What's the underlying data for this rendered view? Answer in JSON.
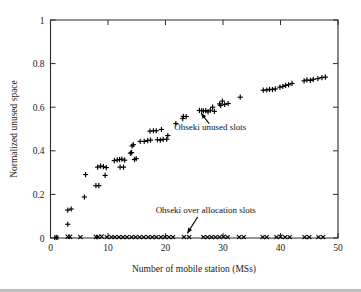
{
  "chart_data": {
    "type": "scatter",
    "title": "",
    "xlabel": "Number of mobile station (MSs)",
    "ylabel": "Normalized unused space",
    "xlim": [
      0,
      50
    ],
    "ylim": [
      0,
      1
    ],
    "xticks": [
      0,
      10,
      20,
      30,
      40,
      50
    ],
    "yticks": [
      0,
      0.2,
      0.4,
      0.6,
      0.8,
      1
    ],
    "xtick_labels": [
      "0",
      "10",
      "20",
      "30",
      "40",
      "50"
    ],
    "ytick_labels": [
      "0",
      "0.2",
      "0.4",
      "0.6",
      "0.8",
      "1"
    ],
    "grid": false,
    "legend": "none",
    "annotations": [
      {
        "id": "unused-slots",
        "text": "Ohseki unused slots",
        "text_x": 27.8,
        "text_y": 0.495,
        "arrow_from_x": 27.6,
        "arrow_from_y": 0.525,
        "arrow_to_x": 26.2,
        "arrow_to_y": 0.572
      },
      {
        "id": "over-allocation-slots",
        "text": "Ohseki over allocation slots",
        "text_x": 27.0,
        "text_y": 0.115,
        "arrow_from_x": 25.6,
        "arrow_from_y": 0.097,
        "arrow_to_x": 23.8,
        "arrow_to_y": 0.022
      }
    ],
    "series": [
      {
        "name": "Ohseki unused slots",
        "marker": "plus",
        "color": "#000000",
        "points": [
          [
            1,
            0.003
          ],
          [
            3,
            0.063
          ],
          [
            3,
            0.128
          ],
          [
            3.6,
            0.133
          ],
          [
            5.9,
            0.188
          ],
          [
            6.1,
            0.291
          ],
          [
            7.9,
            0.24
          ],
          [
            8.4,
            0.24
          ],
          [
            8.2,
            0.325
          ],
          [
            8.7,
            0.33
          ],
          [
            9.2,
            0.327
          ],
          [
            9.5,
            0.287
          ],
          [
            9.7,
            0.323
          ],
          [
            11.1,
            0.355
          ],
          [
            11.6,
            0.358
          ],
          [
            12.0,
            0.36
          ],
          [
            12.4,
            0.362
          ],
          [
            12.1,
            0.325
          ],
          [
            12.7,
            0.325
          ],
          [
            12.9,
            0.357
          ],
          [
            13.9,
            0.389
          ],
          [
            14.1,
            0.392
          ],
          [
            14.2,
            0.422
          ],
          [
            14.4,
            0.428
          ],
          [
            14.6,
            0.36
          ],
          [
            14.9,
            0.364
          ],
          [
            15.6,
            0.443
          ],
          [
            16.3,
            0.443
          ],
          [
            16.9,
            0.447
          ],
          [
            17.4,
            0.449
          ],
          [
            17.3,
            0.49
          ],
          [
            17.9,
            0.492
          ],
          [
            18.4,
            0.492
          ],
          [
            18.6,
            0.451
          ],
          [
            19.1,
            0.449
          ],
          [
            19.3,
            0.498
          ],
          [
            19.6,
            0.452
          ],
          [
            20.2,
            0.453
          ],
          [
            20.4,
            0.47
          ],
          [
            21.8,
            0.525
          ],
          [
            23.0,
            0.548
          ],
          [
            23.1,
            0.558
          ],
          [
            23.6,
            0.557
          ],
          [
            25.9,
            0.585
          ],
          [
            26.3,
            0.584
          ],
          [
            26.6,
            0.583
          ],
          [
            27.0,
            0.584
          ],
          [
            27.4,
            0.579
          ],
          [
            27.8,
            0.586
          ],
          [
            28.2,
            0.6
          ],
          [
            28.5,
            0.581
          ],
          [
            29.4,
            0.615
          ],
          [
            29.6,
            0.608
          ],
          [
            29.9,
            0.628
          ],
          [
            30.3,
            0.613
          ],
          [
            30.9,
            0.617
          ],
          [
            33.0,
            0.646
          ],
          [
            37.0,
            0.678
          ],
          [
            37.6,
            0.679
          ],
          [
            38.1,
            0.682
          ],
          [
            38.6,
            0.681
          ],
          [
            39.1,
            0.684
          ],
          [
            39.9,
            0.692
          ],
          [
            40.4,
            0.695
          ],
          [
            40.9,
            0.7
          ],
          [
            41.4,
            0.703
          ],
          [
            42.0,
            0.709
          ],
          [
            44.1,
            0.721
          ],
          [
            44.6,
            0.725
          ],
          [
            45.2,
            0.723
          ],
          [
            45.7,
            0.728
          ],
          [
            46.5,
            0.731
          ],
          [
            47.2,
            0.736
          ],
          [
            47.8,
            0.738
          ]
        ]
      },
      {
        "name": "Ohseki over allocation slots",
        "marker": "cross",
        "color": "#000000",
        "points": [
          [
            1.0,
            0.002
          ],
          [
            3.0,
            0.006
          ],
          [
            3.4,
            0.006
          ],
          [
            5.2,
            0.004
          ],
          [
            7.9,
            0.005
          ],
          [
            8.3,
            0.005
          ],
          [
            8.9,
            0.007
          ],
          [
            9.8,
            0.004
          ],
          [
            10.6,
            0.004
          ],
          [
            11.2,
            0.004
          ],
          [
            11.9,
            0.004
          ],
          [
            12.6,
            0.004
          ],
          [
            13.3,
            0.004
          ],
          [
            14.1,
            0.004
          ],
          [
            14.8,
            0.004
          ],
          [
            15.5,
            0.004
          ],
          [
            16.2,
            0.004
          ],
          [
            17.0,
            0.004
          ],
          [
            17.7,
            0.004
          ],
          [
            18.4,
            0.004
          ],
          [
            19.2,
            0.004
          ],
          [
            19.9,
            0.004
          ],
          [
            20.6,
            0.004
          ],
          [
            21.3,
            0.004
          ],
          [
            23.2,
            0.004
          ],
          [
            24.1,
            0.004
          ],
          [
            26.6,
            0.004
          ],
          [
            27.3,
            0.004
          ],
          [
            28.0,
            0.004
          ],
          [
            28.7,
            0.004
          ],
          [
            29.4,
            0.004
          ],
          [
            30.1,
            0.006
          ],
          [
            30.8,
            0.004
          ],
          [
            32.8,
            0.004
          ],
          [
            33.6,
            0.004
          ],
          [
            36.9,
            0.004
          ],
          [
            37.6,
            0.004
          ],
          [
            39.3,
            0.004
          ],
          [
            40.0,
            0.006
          ],
          [
            40.8,
            0.004
          ],
          [
            41.6,
            0.004
          ],
          [
            44.2,
            0.004
          ],
          [
            45.0,
            0.004
          ],
          [
            46.6,
            0.004
          ],
          [
            47.4,
            0.004
          ]
        ]
      }
    ]
  }
}
